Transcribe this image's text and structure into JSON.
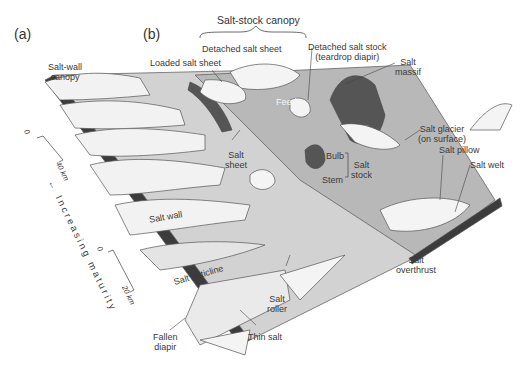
{
  "panels": {
    "a": "(a)",
    "b": "(b)"
  },
  "group_title": "Salt-stock canopy",
  "labels": {
    "salt_wall_canopy": [
      "Salt-wall",
      "canopy"
    ],
    "loaded_salt_sheet": "Loaded salt sheet",
    "detached_salt_sheet": "Detached salt sheet",
    "detached_salt_stock": [
      "Detached salt stock",
      "(teardrop diapir)"
    ],
    "salt_massif": [
      "Salt",
      "massif"
    ],
    "feeder": "Feeder",
    "salt_glacier": [
      "Salt glacier",
      "(on surface)"
    ],
    "salt_sheet": [
      "Salt",
      "sheet"
    ],
    "bulb": "Bulb",
    "stem": "Stem",
    "salt_stock": [
      "Salt",
      "stock"
    ],
    "salt_pillow": "Salt pillow",
    "salt_welt": "Salt welt",
    "salt_wall": "Salt wall",
    "salt_anticline": "Salt anticline",
    "salt_overthrust": [
      "Salt",
      "overthrust"
    ],
    "salt_roller": [
      "Salt",
      "roller"
    ],
    "fallen_diapir": [
      "Fallen",
      "diapir"
    ],
    "thin_salt": "Thin salt"
  },
  "axis": {
    "label": "Increasing maturity",
    "arrow": "←"
  },
  "scales": [
    {
      "zero": "0",
      "end": "40 km"
    },
    {
      "zero": "0",
      "end": "20 km"
    }
  ],
  "colors": {
    "dark_salt": "#5a5a5a",
    "mid_gray": "#b4b4b4",
    "light": "#e8e8e8",
    "outline": "#555555"
  }
}
